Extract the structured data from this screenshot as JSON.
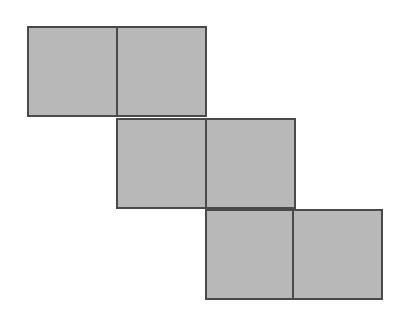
{
  "diagram": {
    "type": "cube-net",
    "fill_color": "#b8b8b8",
    "stroke_color": "#4a4a4a",
    "background": "#ffffff",
    "stroke_width": 2,
    "square_size": 89,
    "squares": [
      {
        "row": 0,
        "col": 0,
        "x": 28,
        "y": 27
      },
      {
        "row": 0,
        "col": 1,
        "x": 117,
        "y": 27
      },
      {
        "row": 1,
        "col": 1,
        "x": 117,
        "y": 119
      },
      {
        "row": 1,
        "col": 2,
        "x": 206,
        "y": 119
      },
      {
        "row": 2,
        "col": 2,
        "x": 206,
        "y": 210
      },
      {
        "row": 2,
        "col": 3,
        "x": 293,
        "y": 210
      }
    ]
  }
}
